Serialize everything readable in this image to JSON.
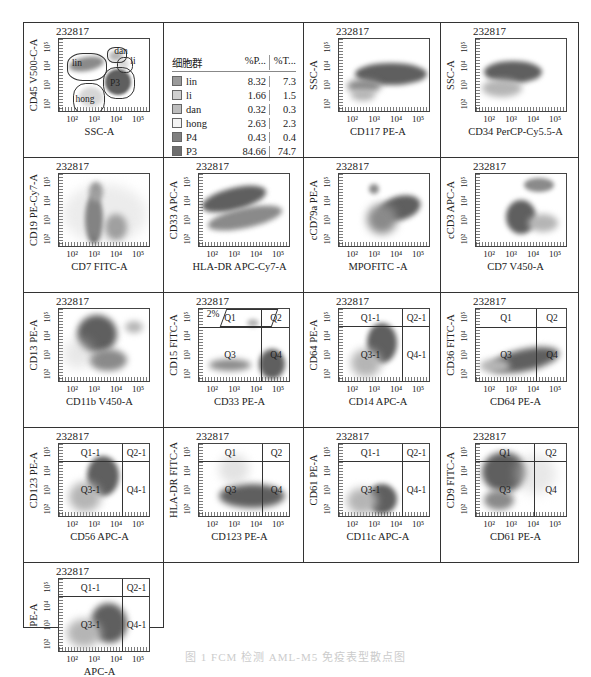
{
  "sample_id": "232817",
  "caption": "图 1  FCM 检测 AML-M5 免疫表型散点图",
  "colors": {
    "dense": "#5f5f5f",
    "mid": "#8a8a8a",
    "light": "#b5b5b5",
    "faint": "#d6d6d6",
    "border": "#333333"
  },
  "legend": {
    "headers": [
      "细胞群",
      "%P...",
      "%T..."
    ],
    "rows": [
      {
        "name": "lin",
        "p": "8.32",
        "t": "7.3",
        "color": "#9a9a9a"
      },
      {
        "name": "li",
        "p": "1.66",
        "t": "1.5",
        "color": "#cfcfcf"
      },
      {
        "name": "dan",
        "p": "0.32",
        "t": "0.3",
        "color": "#bdbdbd"
      },
      {
        "name": "hong",
        "p": "2.63",
        "t": "2.3",
        "color": "#f4f4f4"
      },
      {
        "name": "P4",
        "p": "0.43",
        "t": "0.4",
        "color": "#808080"
      },
      {
        "name": "P3",
        "p": "84.66",
        "t": "74.7",
        "color": "#6e6e6e"
      }
    ]
  },
  "y_ticks": [
    "10²",
    "10³",
    "10⁴",
    "10⁵"
  ],
  "x_ticks": [
    "10²",
    "10³",
    "10⁴",
    "10⁵"
  ],
  "chart_data": [
    {
      "type": "scatter",
      "id": "p1",
      "title": "232817",
      "xlabel": "SSC-A",
      "ylabel": "CD45 V500-C-A",
      "gates": [
        "lin",
        "dan",
        "li",
        "P3",
        "hong"
      ]
    },
    {
      "type": "table",
      "id": "legend",
      "title": "细胞群",
      "columns": [
        "细胞群",
        "%P...",
        "%T..."
      ],
      "rows": [
        [
          "lin",
          "8.32",
          "7.3"
        ],
        [
          "li",
          "1.66",
          "1.5"
        ],
        [
          "dan",
          "0.32",
          "0.3"
        ],
        [
          "hong",
          "2.63",
          "2.3"
        ],
        [
          "P4",
          "0.43",
          "0.4"
        ],
        [
          "P3",
          "84.66",
          "74.7"
        ]
      ]
    },
    {
      "type": "scatter",
      "id": "p3",
      "title": "232817",
      "xlabel": "CD117 PE-A",
      "ylabel": "SSC-A"
    },
    {
      "type": "scatter",
      "id": "p4",
      "title": "232817",
      "xlabel": "CD34 PerCP-Cy5.5-A",
      "ylabel": "SSC-A"
    },
    {
      "type": "scatter",
      "id": "p5",
      "title": "232817",
      "xlabel": "CD7 FITC-A",
      "ylabel": "CD19 PE-Cy7-A"
    },
    {
      "type": "scatter",
      "id": "p6",
      "title": "232817",
      "xlabel": "HLA-DR APC-Cy7-A",
      "ylabel": "CD33 APC-A"
    },
    {
      "type": "scatter",
      "id": "p7",
      "title": "232817",
      "xlabel": "MPOFITC -A",
      "ylabel": "cCD79a PE-A"
    },
    {
      "type": "scatter",
      "id": "p8",
      "title": "232817",
      "xlabel": "CD7 V450-A",
      "ylabel": "cCD3 APC-A"
    },
    {
      "type": "scatter",
      "id": "p9",
      "title": "232817",
      "xlabel": "CD11b V450-A",
      "ylabel": "CD13 PE-A"
    },
    {
      "type": "scatter",
      "id": "p10",
      "title": "232817",
      "xlabel": "CD33 PE-A",
      "ylabel": "CD15 FITC-A",
      "quadrants": [
        "Q1",
        "Q2",
        "Q3",
        "Q4"
      ],
      "annotation": "2%"
    },
    {
      "type": "scatter",
      "id": "p11",
      "title": "232817",
      "xlabel": "CD14 APC-A",
      "ylabel": "CD64 PE-A",
      "quadrants": [
        "Q1-1",
        "Q2-1",
        "Q3-1",
        "Q4-1"
      ]
    },
    {
      "type": "scatter",
      "id": "p12",
      "title": "232817",
      "xlabel": "CD64 PE-A",
      "ylabel": "CD36 FITC-A",
      "quadrants": [
        "Q1",
        "Q2",
        "Q3",
        "Q4"
      ]
    },
    {
      "type": "scatter",
      "id": "p13",
      "title": "232817",
      "xlabel": "CD56 APC-A",
      "ylabel": "CD123 PE-A",
      "quadrants": [
        "Q1-1",
        "Q2-1",
        "Q3-1",
        "Q4-1"
      ]
    },
    {
      "type": "scatter",
      "id": "p14",
      "title": "232817",
      "xlabel": "CD123 PE-A",
      "ylabel": "HLA-DR FITC-A",
      "quadrants": [
        "Q1",
        "Q2",
        "Q3",
        "Q4"
      ]
    },
    {
      "type": "scatter",
      "id": "p15",
      "title": "232817",
      "xlabel": "CD11c APC-A",
      "ylabel": "CD61 PE-A",
      "quadrants": [
        "Q1-1",
        "Q2-1",
        "Q3-1",
        "Q4-1"
      ]
    },
    {
      "type": "scatter",
      "id": "p16",
      "title": "232817",
      "xlabel": "CD61 PE-A",
      "ylabel": "CD9 FITC-A",
      "quadrants": [
        "Q1",
        "Q2",
        "Q3",
        "Q4"
      ]
    },
    {
      "type": "scatter",
      "id": "p17",
      "title": "232817",
      "xlabel": "APC-A",
      "ylabel": "PE-A",
      "quadrants": [
        "Q1-1",
        "Q2-1",
        "Q3-1",
        "Q4-1"
      ]
    }
  ],
  "plots": {
    "p1": {
      "x": "SSC-A",
      "y": "CD45 V500-C-A",
      "g": {
        "lin": "lin",
        "dan": "dan",
        "li": "li",
        "p3": "P3",
        "hong": "hong"
      }
    },
    "p3": {
      "x": "CD117 PE-A",
      "y": "SSC-A"
    },
    "p4": {
      "x": "CD34 PerCP-Cy5.5-A",
      "y": "SSC-A"
    },
    "p5": {
      "x": "CD7 FITC-A",
      "y": "CD19 PE-Cy7-A"
    },
    "p6": {
      "x": "HLA-DR APC-Cy7-A",
      "y": "CD33 APC-A"
    },
    "p7": {
      "x": "MPOFITC -A",
      "y": "cCD79a PE-A"
    },
    "p8": {
      "x": "CD7 V450-A",
      "y": "cCD3 APC-A"
    },
    "p9": {
      "x": "CD11b V450-A",
      "y": "CD13 PE-A"
    },
    "p10": {
      "x": "CD33 PE-A",
      "y": "CD15 FITC-A",
      "q": [
        "Q1",
        "Q2",
        "Q3",
        "Q4"
      ],
      "note": "2%"
    },
    "p11": {
      "x": "CD14 APC-A",
      "y": "CD64 PE-A",
      "q": [
        "Q1-1",
        "Q2-1",
        "Q3-1",
        "Q4-1"
      ]
    },
    "p12": {
      "x": "CD64 PE-A",
      "y": "CD36 FITC-A",
      "q": [
        "Q1",
        "Q2",
        "Q3",
        "Q4"
      ]
    },
    "p13": {
      "x": "CD56 APC-A",
      "y": "CD123 PE-A",
      "q": [
        "Q1-1",
        "Q2-1",
        "Q3-1",
        "Q4-1"
      ]
    },
    "p14": {
      "x": "CD123 PE-A",
      "y": "HLA-DR FITC-A",
      "q": [
        "Q1",
        "Q2",
        "Q3",
        "Q4"
      ]
    },
    "p15": {
      "x": "CD11c APC-A",
      "y": "CD61 PE-A",
      "q": [
        "Q1-1",
        "Q2-1",
        "Q3-1",
        "Q4-1"
      ]
    },
    "p16": {
      "x": "CD61 PE-A",
      "y": "CD9 FITC-A",
      "q": [
        "Q1",
        "Q2",
        "Q3",
        "Q4"
      ]
    },
    "p17": {
      "x": "APC-A",
      "y": "PE-A",
      "q": [
        "Q1-1",
        "Q2-1",
        "Q3-1",
        "Q4-1"
      ]
    }
  }
}
